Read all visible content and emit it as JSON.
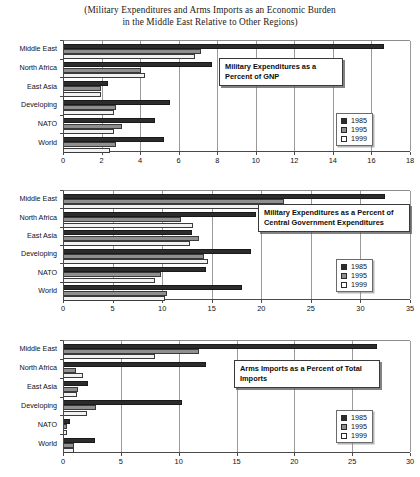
{
  "figure": {
    "title_line1": "(Military Expenditures and Arms Imports as an Economic Burden",
    "title_line2": "in the Middle East Relative to Other Regions)",
    "footer_partial": ""
  },
  "legend": {
    "items": [
      {
        "label": "1985",
        "color": "#2c2c2c",
        "key": "s1985"
      },
      {
        "label": "1995",
        "color": "#8f8f8f",
        "key": "s1995"
      },
      {
        "label": "1999",
        "color": "#ffffff",
        "key": "s1999"
      }
    ]
  },
  "chart_data": [
    {
      "id": "chart-gnp",
      "type": "bar",
      "orientation": "horizontal",
      "title": "Military Expenditures as a\nPercent of GNP",
      "callout_line1": "Military Expenditures as a",
      "callout_line2": "Percent of GNP",
      "categories": [
        "Middle East",
        "North Africa",
        "East Asia",
        "Developing",
        "NATO",
        "World"
      ],
      "series": [
        {
          "name": "1985",
          "values": [
            16.6,
            7.7,
            2.3,
            5.5,
            4.7,
            5.2
          ]
        },
        {
          "name": "1995",
          "values": [
            7.1,
            4.0,
            1.9,
            2.7,
            3.0,
            2.7
          ]
        },
        {
          "name": "1999",
          "values": [
            6.8,
            4.2,
            1.9,
            2.6,
            2.6,
            2.4
          ]
        }
      ],
      "xlabel": "",
      "ylabel": "",
      "xlim": [
        0,
        18
      ],
      "xticks": [
        0,
        2,
        4,
        6,
        8,
        10,
        12,
        14,
        16,
        18
      ],
      "grid": true,
      "legend_position": "bottom-right"
    },
    {
      "id": "chart-cge",
      "type": "bar",
      "orientation": "horizontal",
      "title": "Military Expenditures as a Percent of\nCentral Government Expenditures",
      "callout_line1": "Military Expenditures as a Percent of",
      "callout_line2": "Central Government Expenditures",
      "categories": [
        "Middle East",
        "North Africa",
        "East Asia",
        "Developing",
        "NATO",
        "World"
      ],
      "series": [
        {
          "name": "1985",
          "values": [
            32.4,
            19.4,
            12.9,
            18.9,
            14.3,
            18.0
          ]
        },
        {
          "name": "1995",
          "values": [
            22.2,
            11.8,
            13.6,
            14.1,
            9.8,
            10.4
          ]
        },
        {
          "name": "1999",
          "values": [
            21.4,
            13.0,
            12.7,
            14.5,
            9.2,
            10.2
          ]
        }
      ],
      "xlabel": "",
      "ylabel": "",
      "xlim": [
        0,
        35
      ],
      "xticks": [
        0,
        5,
        10,
        15,
        20,
        25,
        30,
        35
      ],
      "grid": true,
      "legend_position": "bottom-right"
    },
    {
      "id": "chart-arms",
      "type": "bar",
      "orientation": "horizontal",
      "title": "Arms Imports as a Percent of Total\nImports",
      "callout_line1": "Arms Imports as a Percent of Total",
      "callout_line2": "Imports",
      "categories": [
        "Middle East",
        "North Africa",
        "East Asia",
        "Developing",
        "NATO",
        "World"
      ],
      "series": [
        {
          "name": "1985",
          "values": [
            27.1,
            12.3,
            2.1,
            10.2,
            0.5,
            2.7
          ]
        },
        {
          "name": "1995",
          "values": [
            11.7,
            1.0,
            1.2,
            2.8,
            0.3,
            0.9
          ]
        },
        {
          "name": "1999",
          "values": [
            7.9,
            1.6,
            1.1,
            2.0,
            0.3,
            0.9
          ]
        }
      ],
      "xlabel": "",
      "ylabel": "",
      "xlim": [
        0,
        30
      ],
      "xticks": [
        0,
        5,
        10,
        15,
        20,
        25,
        30
      ],
      "grid": true,
      "legend_position": "bottom-right"
    }
  ]
}
